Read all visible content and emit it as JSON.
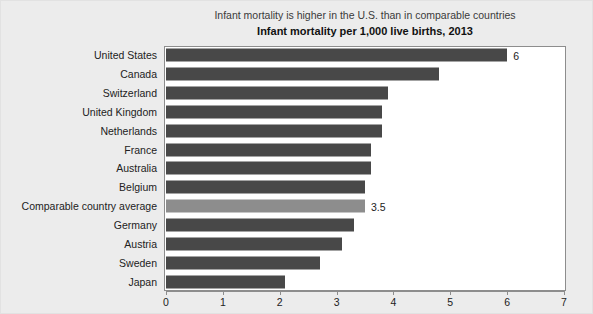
{
  "chart_data": {
    "type": "bar",
    "orientation": "horizontal",
    "title": "Infant mortality per 1,000 live births, 2013",
    "subtitle": "Infant mortality is higher in the U.S. than in comparable countries",
    "xlabel": "",
    "ylabel": "",
    "xlim": [
      0,
      7
    ],
    "xticks": [
      "0",
      "1",
      "2",
      "3",
      "4",
      "5",
      "6",
      "7"
    ],
    "grid": false,
    "legend": "none",
    "bar_color": "#484848",
    "highlight_color": "#8d8d8d",
    "categories": [
      "United States",
      "Canada",
      "Switzerland",
      "United Kingdom",
      "Netherlands",
      "France",
      "Australia",
      "Belgium",
      "Comparable country average",
      "Germany",
      "Austria",
      "Sweden",
      "Japan"
    ],
    "values": [
      6.0,
      4.8,
      3.9,
      3.8,
      3.8,
      3.6,
      3.6,
      3.5,
      3.5,
      3.3,
      3.1,
      2.7,
      2.1
    ],
    "bars": [
      {
        "label": "United States",
        "value": 6.0,
        "data_label": "6",
        "highlight": false
      },
      {
        "label": "Canada",
        "value": 4.8,
        "data_label": "",
        "highlight": false
      },
      {
        "label": "Switzerland",
        "value": 3.9,
        "data_label": "",
        "highlight": false
      },
      {
        "label": "United Kingdom",
        "value": 3.8,
        "data_label": "",
        "highlight": false
      },
      {
        "label": "Netherlands",
        "value": 3.8,
        "data_label": "",
        "highlight": false
      },
      {
        "label": "France",
        "value": 3.6,
        "data_label": "",
        "highlight": false
      },
      {
        "label": "Australia",
        "value": 3.6,
        "data_label": "",
        "highlight": false
      },
      {
        "label": "Belgium",
        "value": 3.5,
        "data_label": "",
        "highlight": false
      },
      {
        "label": "Comparable country average",
        "value": 3.5,
        "data_label": "3.5",
        "highlight": true
      },
      {
        "label": "Germany",
        "value": 3.3,
        "data_label": "",
        "highlight": false
      },
      {
        "label": "Austria",
        "value": 3.1,
        "data_label": "",
        "highlight": false
      },
      {
        "label": "Sweden",
        "value": 2.7,
        "data_label": "",
        "highlight": false
      },
      {
        "label": "Japan",
        "value": 2.1,
        "data_label": "",
        "highlight": false
      }
    ]
  }
}
